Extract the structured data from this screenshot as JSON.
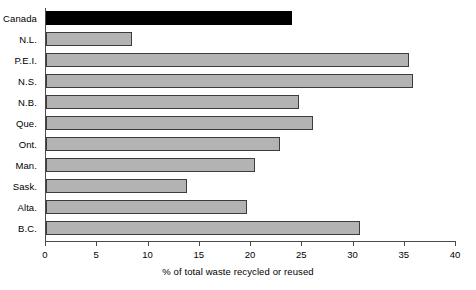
{
  "chart_data": {
    "type": "bar",
    "orientation": "horizontal",
    "title": "",
    "xlabel": "% of total waste recycled or reused",
    "ylabel": "",
    "categories": [
      "Canada",
      "N.L.",
      "P.E.I.",
      "N.S.",
      "N.B.",
      "Que.",
      "Ont.",
      "Man.",
      "Sask.",
      "Alta.",
      "B.C."
    ],
    "values": [
      24.0,
      8.4,
      35.4,
      35.8,
      24.7,
      26.0,
      22.8,
      20.4,
      13.8,
      19.6,
      30.6
    ],
    "xlim": [
      0,
      40
    ],
    "xticks": [
      0,
      5,
      10,
      15,
      20,
      25,
      30,
      35,
      40
    ],
    "xtick_labels": [
      "0",
      "5",
      "10",
      "15",
      "20",
      "25",
      "30",
      "35",
      "40"
    ],
    "grid": false,
    "legend": "none",
    "highlight_category": "Canada",
    "colors": {
      "bar_fill": "#b3b3b3",
      "bar_border": "#3c3c3c",
      "highlight_fill": "#000000",
      "axis": "#4a4a4a",
      "text": "#000000",
      "background": "#ffffff"
    }
  }
}
